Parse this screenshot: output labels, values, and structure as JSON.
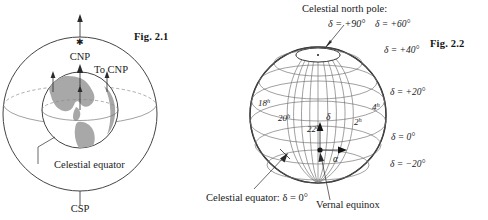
{
  "sheet": {
    "background_color": "#ffffff",
    "ink_color": "#1c1c1c",
    "land_fill_color": "#a8a8a8",
    "grid_color": "#6d6d6d"
  },
  "figures": [
    {
      "id": "fig-2-1",
      "caption": "Fig. 2.1",
      "labels": {
        "north_pole": "CNP",
        "south_pole": "CSP",
        "to_pole_arrows": "To CNP",
        "equator": "Celestial equator"
      },
      "icons": {
        "pole_star": "star-icon",
        "direction_arrow": "up-arrow-icon"
      }
    },
    {
      "id": "fig-2-2",
      "caption": "Fig. 2.2",
      "labels": {
        "north_pole_title": "Celestial north pole:",
        "north_pole_value": "δ = +90°",
        "equator_callout": "Celestial equator: δ = 0°",
        "vernal_equinox": "Vernal equinox",
        "declination_symbol": "δ",
        "right_ascension_symbol": "α"
      },
      "declination_labels": [
        {
          "text": "δ = +60°",
          "value": 60
        },
        {
          "text": "δ = +40°",
          "value": 40
        },
        {
          "text": "δ = +20°",
          "value": 20
        },
        {
          "text": "δ = 0°",
          "value": 0
        },
        {
          "text": "δ = −20°",
          "value": -20
        }
      ],
      "right_ascension_labels": [
        {
          "base": "18",
          "superscript": "h"
        },
        {
          "base": "20",
          "superscript": "h"
        },
        {
          "base": "22",
          "superscript": "h"
        },
        {
          "base": "2",
          "superscript": "h"
        },
        {
          "base": "4",
          "superscript": "h"
        }
      ]
    }
  ]
}
